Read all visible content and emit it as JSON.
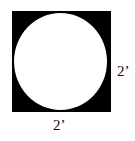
{
  "diagram": {
    "shape": "circle inscribed in square",
    "square_color": "#000000",
    "circle_color": "#ffffff",
    "labels": {
      "side_right": "2’",
      "side_bottom": "2’"
    }
  }
}
